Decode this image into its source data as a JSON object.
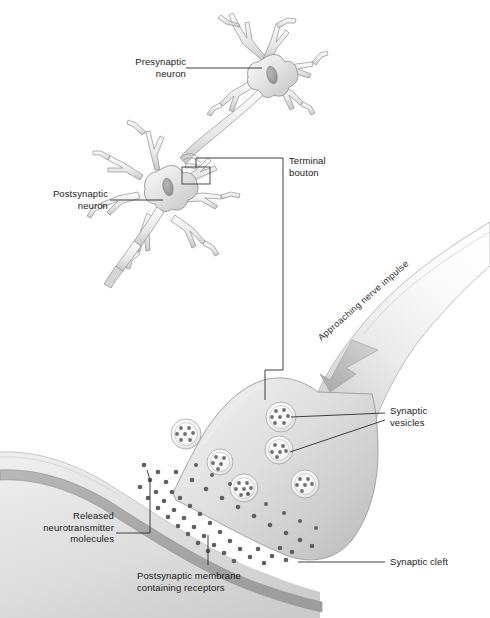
{
  "figure": {
    "background_color": "#ffffff",
    "ink_color": "#1a1a1a",
    "cell_fill_light": "#f2f2f2",
    "cell_fill_mid": "#d8d8d8",
    "cell_fill_dark": "#b4b4b4",
    "outline_color": "#8a8a8a",
    "vesicle_dot_color": "#6f6f74",
    "neurotransmitter_color": "#5e5e66"
  },
  "labels": {
    "presynaptic_neuron": "Presynaptic\nneuron",
    "postsynaptic_neuron": "Postsynaptic\nneuron",
    "terminal_bouton": "Terminal\nbouton",
    "approaching_nerve_impulse": "Approaching nerve impulse",
    "synaptic_vesicles": "Synaptic\nvesicles",
    "released_neurotransmitter_molecules": "Released\nneurotransmitter\nmolecules",
    "postsynaptic_membrane": "Postsynaptic membrane\ncontaining receptors",
    "synaptic_cleft": "Synaptic cleft"
  },
  "structures": {
    "presynaptic_soma": "star-shaped cell body with nucleus and branching dendrites",
    "postsynaptic_soma": "star-shaped cell body with nucleus, dendrites and descending axon",
    "inset_box": "rectangle marking the terminal bouton region",
    "axon_terminal": "enlarged bulb-shaped presynaptic terminal",
    "impulse_arrow": "arrowhead pointing down-left along the axon",
    "vesicle_count": 6,
    "cleft": "narrow white gap between terminal and postsynaptic membrane"
  }
}
